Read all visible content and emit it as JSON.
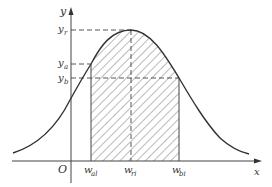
{
  "diagram": {
    "type": "bell-curve-with-hatched-region",
    "colors": {
      "curve": "#333333",
      "axes": "#444444",
      "hatch": "#666666",
      "background": "#ffffff"
    },
    "axes": {
      "x_label": "x",
      "y_label": "y",
      "origin_label": "O"
    },
    "y_marks": [
      {
        "base": "y",
        "sub": "r"
      },
      {
        "base": "y",
        "sub": "a"
      },
      {
        "base": "y",
        "sub": "b"
      }
    ],
    "x_marks": [
      {
        "base": "w",
        "sub": "al"
      },
      {
        "base": "w",
        "sub": "ri"
      },
      {
        "base": "w",
        "sub": "bi"
      }
    ]
  }
}
